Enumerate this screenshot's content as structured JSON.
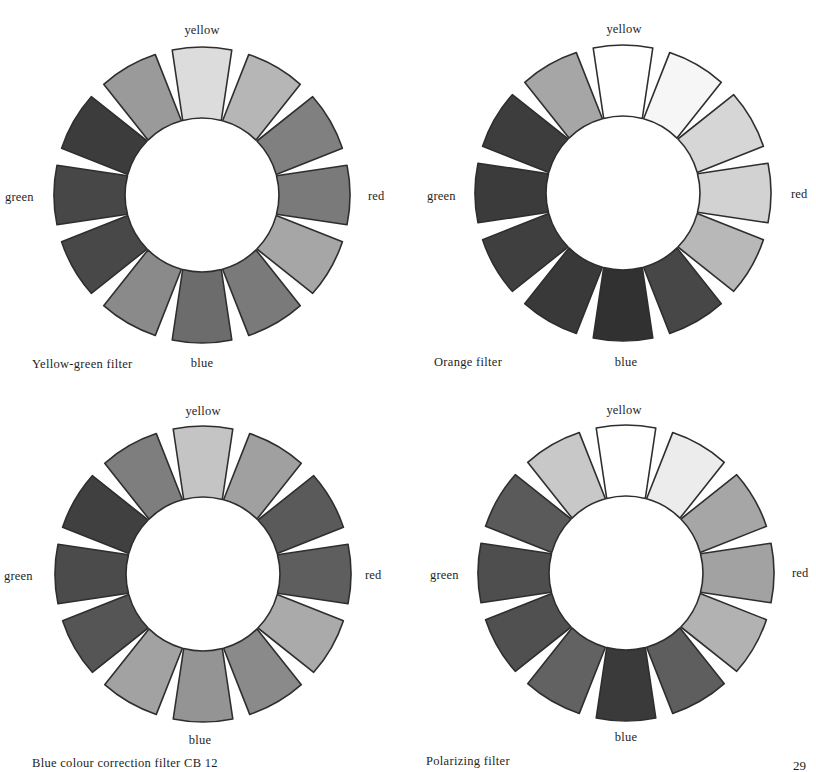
{
  "page_number": "29",
  "geometry": {
    "r_outer": 148,
    "r_inner": 77,
    "half_angle_outer_deg": 11.6,
    "half_angle_inner_deg": 14.5
  },
  "outline_color": "#2e2e2e",
  "wheels": [
    {
      "caption": "Yellow-green filter",
      "center": [
        202,
        195
      ],
      "labels": {
        "yellow": "yellow",
        "red": "red",
        "green": "green",
        "blue": "blue"
      },
      "segment_shades": [
        "#dcdcdc",
        "#b6b6b6",
        "#808080",
        "#7a7a7a",
        "#a6a6a6",
        "#7a7a7a",
        "#6c6c6c",
        "#8a8a8a",
        "#484848",
        "#474747",
        "#3c3c3c",
        "#9a9a9a"
      ]
    },
    {
      "caption": "Orange filter",
      "center": [
        623,
        193
      ],
      "labels": {
        "yellow": "yellow",
        "red": "red",
        "green": "green",
        "blue": "blue"
      },
      "segment_shades": [
        "#ffffff",
        "#f6f6f6",
        "#d6d6d6",
        "#d2d2d2",
        "#b8b8b8",
        "#474747",
        "#313131",
        "#393939",
        "#3f3f3f",
        "#3b3b3b",
        "#3d3d3d",
        "#a6a6a6"
      ]
    },
    {
      "caption": "Blue colour correction filter CB 12",
      "center": [
        203,
        574
      ],
      "labels": {
        "yellow": "yellow",
        "red": "red",
        "green": "green",
        "blue": "blue"
      },
      "segment_shades": [
        "#c4c4c4",
        "#a0a0a0",
        "#5a5a5a",
        "#5e5e5e",
        "#aaaaaa",
        "#8a8a8a",
        "#949494",
        "#a2a2a2",
        "#555555",
        "#4b4b4b",
        "#404040",
        "#7e7e7e"
      ]
    },
    {
      "caption": "Polarizing filter",
      "center": [
        626,
        573
      ],
      "labels": {
        "yellow": "yellow",
        "red": "red",
        "green": "green",
        "blue": "blue"
      },
      "segment_shades": [
        "#ffffff",
        "#ececec",
        "#a6a6a6",
        "#a2a2a2",
        "#b2b2b2",
        "#5e5e5e",
        "#3a3a3a",
        "#626262",
        "#505050",
        "#4e4e4e",
        "#5a5a5a",
        "#c8c8c8"
      ]
    }
  ]
}
